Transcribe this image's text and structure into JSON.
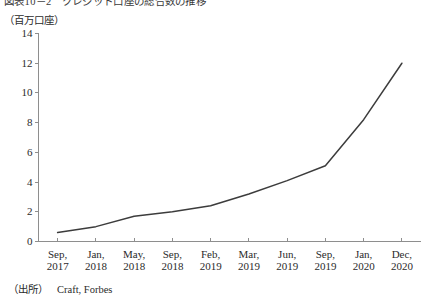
{
  "figure": {
    "title": "図表10－2　クレジット口座の総合数の推移",
    "y_unit_caption": "（百万口座）",
    "source_label": "（出所）",
    "source_text": "Craft, Forbes"
  },
  "chart_data": {
    "type": "line",
    "title": "図表10－2　クレジット口座の総合数の推移",
    "xlabel": "",
    "ylabel": "（百万口座）",
    "ylim": [
      0,
      14
    ],
    "yticks": [
      0,
      2,
      4,
      6,
      8,
      10,
      12,
      14
    ],
    "ytick_labels": [
      "0",
      "2",
      "4",
      "6",
      "8",
      "10",
      "12",
      "14"
    ],
    "grid": false,
    "legend": "none",
    "line_color": "#3c3c3c",
    "categories": [
      "Sep, 2017",
      "Jan, 2018",
      "May, 2018",
      "Sep, 2018",
      "Feb, 2019",
      "Mar, 2019",
      "Jun, 2019",
      "Sep, 2019",
      "Jan, 2020",
      "Dec, 2020"
    ],
    "category_lines": [
      {
        "month": "Sep,",
        "year": "2017"
      },
      {
        "month": "Jan,",
        "year": "2018"
      },
      {
        "month": "May,",
        "year": "2018"
      },
      {
        "month": "Sep,",
        "year": "2018"
      },
      {
        "month": "Feb,",
        "year": "2019"
      },
      {
        "month": "Mar,",
        "year": "2019"
      },
      {
        "month": "Jun,",
        "year": "2019"
      },
      {
        "month": "Sep,",
        "year": "2019"
      },
      {
        "month": "Jan,",
        "year": "2020"
      },
      {
        "month": "Dec,",
        "year": "2020"
      }
    ],
    "values": [
      0.6,
      1.0,
      1.7,
      2.0,
      2.4,
      3.2,
      4.1,
      5.1,
      8.2,
      12.0
    ]
  }
}
